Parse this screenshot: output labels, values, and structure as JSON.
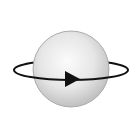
{
  "diagram": {
    "title": "Rotating sphere",
    "elements": [
      {
        "type": "sphere",
        "name": "sphere",
        "center": [
          71,
          69
        ],
        "radius": 38
      },
      {
        "type": "ring",
        "name": "orbit-ring",
        "center": [
          71,
          70
        ],
        "rx": 57,
        "ry": 10
      },
      {
        "type": "arrow",
        "name": "direction-arrow",
        "direction": "right"
      }
    ],
    "colors": {
      "background": "#ffffff",
      "sphere_light": "#f6f6f6",
      "sphere_dark": "#bdbdbd",
      "stroke": "#111111"
    }
  }
}
